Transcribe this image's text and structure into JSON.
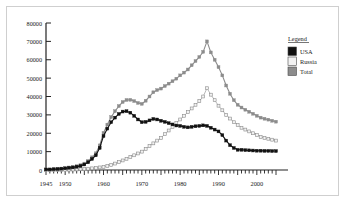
{
  "chart_data": {
    "type": "line",
    "title": "",
    "subtitle": "",
    "xlabel": "",
    "ylabel": "",
    "xlim": [
      1945,
      2005
    ],
    "ylim": [
      0,
      80000
    ],
    "grid": false,
    "legend": {
      "position": "right",
      "title": "Legend",
      "entries": [
        {
          "name": "USA",
          "color": "#111111",
          "marker": "filled-square"
        },
        {
          "name": "Russia",
          "color": "#f2f2f2",
          "marker": "open-square"
        },
        {
          "name": "Total",
          "color": "#8c8c8c",
          "marker": "filled-square"
        }
      ]
    },
    "ytick_labels": [
      "0",
      "10000",
      "20000",
      "30000",
      "40000",
      "50000",
      "60000",
      "70000",
      "80000"
    ],
    "ytick_values": [
      0,
      10000,
      20000,
      30000,
      40000,
      50000,
      60000,
      70000,
      80000
    ],
    "xtick_labels": [
      "1945",
      "1950",
      "1960",
      "1970",
      "1980",
      "1990",
      "2000"
    ],
    "xtick_values": [
      1945,
      1950,
      1960,
      1970,
      1980,
      1990,
      2000
    ],
    "x": [
      1945,
      1946,
      1947,
      1948,
      1949,
      1950,
      1951,
      1952,
      1953,
      1954,
      1955,
      1956,
      1957,
      1958,
      1959,
      1960,
      1961,
      1962,
      1963,
      1964,
      1965,
      1966,
      1967,
      1968,
      1969,
      1970,
      1971,
      1972,
      1973,
      1974,
      1975,
      1976,
      1977,
      1978,
      1979,
      1980,
      1981,
      1982,
      1983,
      1984,
      1985,
      1986,
      1987,
      1988,
      1989,
      1990,
      1991,
      1992,
      1993,
      1994,
      1995,
      1996,
      1997,
      1998,
      1999,
      2000,
      2001,
      2002,
      2003,
      2004,
      2005
    ],
    "series": [
      {
        "name": "USA",
        "color": "#111111",
        "values": [
          300,
          300,
          400,
          500,
          700,
          900,
          1200,
          1400,
          1800,
          2200,
          3000,
          4200,
          6000,
          8000,
          12000,
          18500,
          22500,
          26000,
          28500,
          30500,
          31800,
          32000,
          31200,
          29500,
          27500,
          26000,
          26200,
          27000,
          27800,
          27500,
          26800,
          26200,
          25500,
          24800,
          24200,
          24000,
          23500,
          23200,
          23500,
          23800,
          24000,
          24300,
          24000,
          23000,
          22000,
          21000,
          19000,
          16000,
          13500,
          12000,
          11000,
          11000,
          10800,
          10700,
          10600,
          10500,
          10500,
          10400,
          10400,
          10300,
          10300
        ]
      },
      {
        "name": "Russia",
        "color": "#f2f2f2",
        "values": [
          0,
          0,
          0,
          0,
          100,
          150,
          200,
          250,
          300,
          400,
          500,
          700,
          900,
          1100,
          1400,
          1700,
          2200,
          2800,
          3500,
          4300,
          5200,
          6100,
          7000,
          8000,
          9000,
          10000,
          11500,
          13000,
          14500,
          16000,
          17500,
          19500,
          21500,
          23500,
          25500,
          27500,
          29500,
          31500,
          33500,
          35500,
          37500,
          40000,
          44500,
          41000,
          38000,
          35000,
          32500,
          30000,
          28000,
          26000,
          24500,
          23000,
          22000,
          21000,
          20000,
          19000,
          18000,
          17500,
          17000,
          16500,
          16000
        ]
      },
      {
        "name": "Total",
        "color": "#8c8c8c",
        "values": [
          300,
          300,
          400,
          500,
          800,
          1050,
          1400,
          1650,
          2100,
          2600,
          3500,
          4900,
          6900,
          9100,
          13400,
          20200,
          24700,
          28800,
          32000,
          34800,
          37000,
          38100,
          38200,
          37500,
          36500,
          36000,
          37700,
          40000,
          42300,
          43500,
          44300,
          45700,
          47000,
          48300,
          49700,
          51500,
          53000,
          54700,
          57000,
          59300,
          61500,
          64300,
          70000,
          64000,
          60000,
          56000,
          51500,
          46000,
          41500,
          38000,
          35500,
          34000,
          32800,
          31700,
          30600,
          29500,
          28500,
          27900,
          27400,
          26800,
          26300
        ]
      }
    ]
  }
}
